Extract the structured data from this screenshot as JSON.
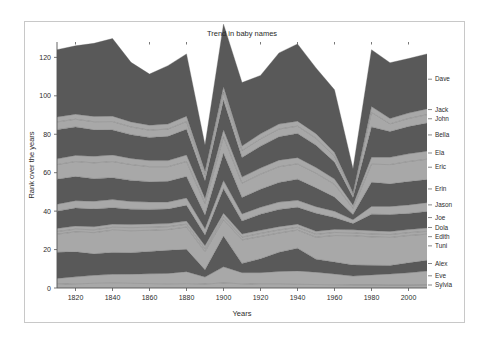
{
  "figure": {
    "background": "#ffffff",
    "frame_color": "#c8c8c8"
  },
  "chart_data": {
    "type": "area",
    "stacked": true,
    "title": "Trend in baby names",
    "xlabel": "Years",
    "ylabel": "Rank over the years",
    "xlim": [
      1810,
      2010
    ],
    "ylim": [
      0,
      128
    ],
    "xticks": [
      1820,
      1840,
      1860,
      1880,
      1900,
      1920,
      1940,
      1960,
      1980,
      2000
    ],
    "yticks": [
      0,
      20,
      40,
      60,
      80,
      100,
      120
    ],
    "grid": false,
    "legend_position": "right-outside",
    "x": [
      1810,
      1820,
      1830,
      1840,
      1850,
      1860,
      1870,
      1880,
      1890,
      1900,
      1910,
      1920,
      1930,
      1940,
      1950,
      1960,
      1970,
      1980,
      1990,
      2000,
      2010
    ],
    "palette": {
      "dark": "#595959",
      "light": "#a8a8a8",
      "edge": "#5d5d5d"
    },
    "series": [
      {
        "name": "Sylvia",
        "color": "#a8a8a8",
        "values": [
          2.0,
          2.2,
          2.4,
          2.5,
          2.4,
          2.3,
          2.2,
          2.3,
          2.1,
          2.6,
          2.2,
          2.0,
          2.0,
          1.9,
          1.8,
          1.7,
          1.6,
          1.6,
          1.5,
          1.5,
          1.6
        ]
      },
      {
        "name": "Eve",
        "color": "#a8a8a8",
        "values": [
          3.0,
          3.6,
          4.2,
          4.6,
          4.8,
          5.1,
          5.4,
          6.2,
          3.6,
          8.4,
          5.8,
          6.0,
          6.6,
          7.0,
          6.4,
          5.6,
          4.6,
          5.2,
          5.8,
          6.4,
          7.2
        ]
      },
      {
        "name": "Alex",
        "color": "#595959",
        "values": [
          13.6,
          13.0,
          11.2,
          11.4,
          11.2,
          11.6,
          12.0,
          11.6,
          3.8,
          16.0,
          4.8,
          7.2,
          10.0,
          11.8,
          6.8,
          6.2,
          5.8,
          5.0,
          4.4,
          5.2,
          5.6
        ]
      },
      {
        "name": "Tuni",
        "color": "#a8a8a8",
        "values": [
          9.4,
          10.4,
          11.0,
          11.6,
          11.4,
          11.0,
          10.8,
          11.6,
          9.4,
          8.6,
          12.2,
          11.6,
          10.0,
          9.4,
          11.4,
          13.8,
          15.2,
          14.8,
          14.6,
          14.2,
          13.6
        ]
      },
      {
        "name": "Edith",
        "color": "#a8a8a8",
        "values": [
          1.4,
          1.4,
          1.5,
          1.5,
          1.6,
          1.6,
          1.5,
          1.5,
          1.5,
          1.6,
          1.5,
          1.6,
          1.6,
          1.5,
          1.5,
          1.6,
          1.5,
          1.5,
          1.5,
          1.5,
          1.5
        ]
      },
      {
        "name": "Dola",
        "color": "#a8a8a8",
        "values": [
          1.6,
          1.6,
          1.6,
          1.6,
          1.6,
          1.7,
          1.6,
          1.6,
          1.6,
          1.7,
          1.6,
          1.6,
          1.7,
          1.6,
          1.6,
          1.6,
          1.6,
          1.7,
          1.6,
          1.6,
          1.7
        ]
      },
      {
        "name": "Joe",
        "color": "#595959",
        "values": [
          9.0,
          9.4,
          9.2,
          8.6,
          8.0,
          7.6,
          7.6,
          8.2,
          5.6,
          12.8,
          6.8,
          8.4,
          9.0,
          8.8,
          9.4,
          6.2,
          3.2,
          8.6,
          8.8,
          8.4,
          8.6
        ]
      },
      {
        "name": "Jason",
        "color": "#a8a8a8",
        "values": [
          3.6,
          3.8,
          4.0,
          4.2,
          4.0,
          3.8,
          3.6,
          3.8,
          3.2,
          4.2,
          3.6,
          3.6,
          3.8,
          3.6,
          3.4,
          3.2,
          2.0,
          4.0,
          4.2,
          4.4,
          4.6
        ]
      },
      {
        "name": "Erin",
        "color": "#595959",
        "values": [
          13.0,
          12.6,
          11.8,
          11.4,
          11.0,
          10.6,
          10.8,
          11.2,
          7.2,
          14.2,
          8.6,
          9.4,
          10.2,
          11.0,
          9.8,
          7.4,
          2.8,
          12.6,
          11.8,
          12.2,
          12.0
        ]
      },
      {
        "name": "Eric",
        "color": "#a8a8a8",
        "values": [
          7.6,
          7.8,
          8.2,
          8.4,
          8.2,
          7.8,
          7.6,
          7.8,
          6.0,
          8.6,
          7.4,
          7.8,
          8.2,
          8.0,
          7.6,
          6.6,
          3.2,
          9.4,
          10.0,
          10.4,
          10.6
        ]
      },
      {
        "name": "Ela",
        "color": "#a8a8a8",
        "values": [
          3.0,
          3.2,
          3.4,
          3.4,
          3.2,
          3.2,
          3.2,
          3.4,
          2.6,
          3.6,
          3.2,
          3.2,
          3.4,
          3.2,
          3.0,
          2.8,
          1.6,
          3.6,
          3.8,
          4.0,
          4.2
        ]
      },
      {
        "name": "Bella",
        "color": "#595959",
        "values": [
          15.2,
          14.8,
          13.8,
          13.0,
          12.4,
          12.0,
          12.6,
          13.4,
          9.2,
          15.4,
          10.2,
          11.4,
          12.2,
          12.6,
          11.6,
          8.8,
          4.0,
          15.8,
          13.4,
          14.2,
          14.6
        ]
      },
      {
        "name": "John",
        "color": "#a8a8a8",
        "values": [
          4.0,
          4.0,
          4.2,
          4.4,
          4.0,
          3.8,
          3.8,
          4.0,
          3.0,
          4.2,
          3.6,
          3.8,
          4.0,
          3.8,
          3.6,
          3.0,
          1.4,
          7.6,
          4.0,
          4.2,
          4.4
        ]
      },
      {
        "name": "Jack",
        "color": "#a8a8a8",
        "values": [
          2.6,
          2.6,
          2.8,
          2.8,
          2.6,
          2.6,
          2.6,
          2.8,
          2.0,
          2.8,
          2.4,
          2.6,
          2.6,
          2.6,
          2.4,
          2.0,
          1.0,
          3.0,
          2.8,
          2.8,
          3.0
        ]
      },
      {
        "name": "Dave",
        "color": "#595959",
        "values": [
          35.0,
          35.6,
          38.0,
          40.4,
          31.0,
          26.6,
          30.4,
          32.4,
          13.6,
          32.6,
          33.0,
          30.4,
          37.0,
          40.2,
          34.2,
          32.6,
          12.6,
          29.6,
          29.0,
          28.4,
          28.6
        ]
      }
    ]
  },
  "axes": {
    "x_tick_labels": [
      "1820",
      "1840",
      "1860",
      "1880",
      "1900",
      "1920",
      "1940",
      "1960",
      "1980",
      "2000"
    ],
    "y_tick_labels": [
      "0",
      "20",
      "40",
      "60",
      "80",
      "100",
      "120"
    ]
  },
  "legend": {
    "labels": [
      {
        "name": "Dave"
      },
      {
        "name": "Jack"
      },
      {
        "name": "John"
      },
      {
        "name": "Bella"
      },
      {
        "name": "Ela"
      },
      {
        "name": "Eric"
      },
      {
        "name": "Erin"
      },
      {
        "name": "Jason"
      },
      {
        "name": "Joe"
      },
      {
        "name": "Dola"
      },
      {
        "name": "Edith"
      },
      {
        "name": "Tuni"
      },
      {
        "name": "Alex"
      },
      {
        "name": "Eve"
      },
      {
        "name": "Sylvia"
      }
    ]
  }
}
